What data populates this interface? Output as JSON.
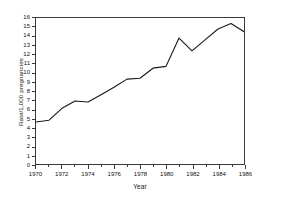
{
  "chart_data": {
    "type": "line",
    "title": "",
    "xlabel": "Year",
    "ylabel": "Rate/1,000 pregnancies",
    "xlim": [
      1970,
      1986
    ],
    "ylim": [
      0,
      16
    ],
    "grid": false,
    "legend": false,
    "line_color": "#1a1a1a",
    "x": [
      1970,
      1971,
      1972,
      1973,
      1974,
      1975,
      1976,
      1977,
      1978,
      1979,
      1980,
      1981,
      1982,
      1983,
      1984,
      1985,
      1986
    ],
    "values": [
      4.6,
      4.8,
      6.1,
      6.9,
      6.8,
      7.6,
      8.4,
      9.3,
      9.4,
      10.5,
      10.7,
      13.8,
      12.4,
      13.6,
      14.8,
      15.4,
      14.5
    ],
    "y_ticks": [
      0,
      1,
      2,
      3,
      4,
      5,
      6,
      7,
      8,
      9,
      10,
      11,
      12,
      13,
      14,
      15,
      16
    ],
    "y_tick_labels": [
      "0",
      "1",
      "2",
      "3",
      "4",
      "5",
      "6",
      "7",
      "8",
      "9",
      "10",
      "11",
      "12",
      "13",
      "14",
      "15",
      "16"
    ],
    "x_ticks_major": [
      1970,
      1972,
      1974,
      1976,
      1978,
      1980,
      1982,
      1984,
      1986
    ],
    "x_tick_labels": [
      "1970",
      "1972",
      "1974",
      "1976",
      "1978",
      "1980",
      "1982",
      "1984",
      "1986"
    ],
    "x_ticks_minor": [
      1971,
      1973,
      1975,
      1977,
      1979,
      1981,
      1983,
      1985
    ]
  }
}
